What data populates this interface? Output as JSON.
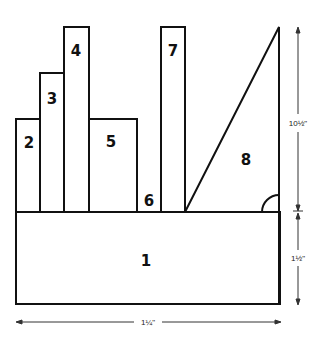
{
  "diagram": {
    "pieces": [
      {
        "id": "1",
        "label": "1"
      },
      {
        "id": "2",
        "label": "2"
      },
      {
        "id": "3",
        "label": "3"
      },
      {
        "id": "4",
        "label": "4"
      },
      {
        "id": "5",
        "label": "5"
      },
      {
        "id": "6",
        "label": "6"
      },
      {
        "id": "7",
        "label": "7"
      },
      {
        "id": "8",
        "label": "8"
      }
    ],
    "dimensions": {
      "upper_height": "10½\"",
      "lower_height": "1½\"",
      "width": "1¼\""
    },
    "colors": {
      "stroke": "#111111",
      "fill": "#ffffff",
      "dim_line": "#333333"
    }
  }
}
